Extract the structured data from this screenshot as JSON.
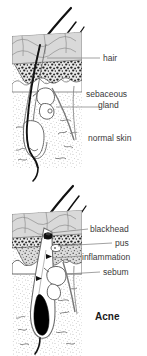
{
  "figure": {
    "name": "skin-cross-section-comparison",
    "background_color": "#ffffff",
    "panels": [
      {
        "id": "normal-skin-panel",
        "caption": "normal skin",
        "labels": [
          {
            "id": "hair",
            "text": "hair"
          },
          {
            "id": "sebaceous-gland-line1",
            "text": "sebaceous"
          },
          {
            "id": "sebaceous-gland-line2",
            "text": "gland"
          }
        ]
      },
      {
        "id": "acne-skin-panel",
        "caption": "Acne",
        "labels": [
          {
            "id": "blackhead",
            "text": "blackhead"
          },
          {
            "id": "pus",
            "text": "pus"
          },
          {
            "id": "inflammation",
            "text": "inflammation"
          },
          {
            "id": "sebum",
            "text": "sebum"
          }
        ]
      }
    ],
    "colors": {
      "epidermis_fill": "#d9d9d9",
      "granular_layer": "#2b2b2b",
      "dermis_stipple": "#9a9a9a",
      "hair_shaft": "#111111",
      "follicle_outline": "#555555",
      "leader_line": "#777777",
      "label_text": "#3a3a3a",
      "title_text": "#1a1a1a",
      "sebum_fill": "#000000"
    }
  }
}
